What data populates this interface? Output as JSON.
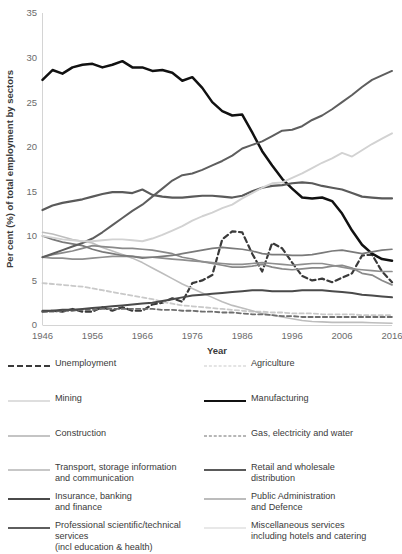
{
  "chart_data": {
    "type": "line",
    "title": "",
    "xlabel": "Year",
    "ylabel": "Per cent (%) of total employment by sectors",
    "xlim": [
      1946,
      2016
    ],
    "ylim": [
      0,
      35
    ],
    "ytick_labels": [
      "0",
      "5",
      "10",
      "15",
      "20",
      "25",
      "30",
      "35"
    ],
    "yticks": [
      0,
      5,
      10,
      15,
      20,
      25,
      30,
      35
    ],
    "xtick_labels": [
      "1946",
      "1956",
      "1966",
      "1976",
      "1986",
      "1996",
      "2006",
      "2016"
    ],
    "xticks": [
      1946,
      1956,
      1966,
      1976,
      1986,
      1996,
      2006,
      2016
    ],
    "grid": false,
    "legend_position": "below",
    "x": [
      1946,
      1948,
      1950,
      1952,
      1954,
      1956,
      1958,
      1960,
      1962,
      1964,
      1966,
      1968,
      1970,
      1972,
      1974,
      1976,
      1978,
      1980,
      1982,
      1984,
      1986,
      1988,
      1990,
      1992,
      1994,
      1996,
      1998,
      2000,
      2002,
      2004,
      2006,
      2008,
      2010,
      2012,
      2014,
      2016
    ],
    "series": [
      {
        "name": "Unemployment",
        "color": "#3a3a3a",
        "style": "dashed",
        "width": 2.2,
        "values": [
          1.5,
          1.6,
          1.5,
          1.8,
          1.5,
          1.5,
          2.0,
          1.6,
          2.0,
          1.6,
          1.6,
          2.3,
          2.5,
          3.0,
          2.6,
          4.7,
          5.0,
          5.6,
          9.6,
          10.5,
          10.4,
          8.0,
          6.0,
          9.2,
          8.6,
          7.0,
          5.5,
          5.0,
          5.2,
          4.8,
          5.3,
          5.8,
          7.8,
          7.9,
          6.0,
          4.8
        ]
      },
      {
        "name": "Agriculture",
        "color": "#c9c9c9",
        "style": "dashed",
        "width": 1.8,
        "values": [
          4.7,
          4.6,
          4.5,
          4.4,
          4.3,
          4.1,
          3.9,
          3.7,
          3.5,
          3.3,
          3.1,
          2.9,
          2.6,
          2.4,
          2.2,
          2.1,
          2.0,
          1.9,
          1.8,
          1.7,
          1.6,
          1.5,
          1.5,
          1.4,
          1.4,
          1.3,
          1.3,
          1.3,
          1.2,
          1.2,
          1.2,
          1.2,
          1.1,
          1.1,
          1.1,
          1.1
        ]
      },
      {
        "name": "Mining",
        "color": "#bdbdbd",
        "style": "solid",
        "width": 1.6,
        "values": [
          10.4,
          10.2,
          9.9,
          9.6,
          9.4,
          9.2,
          8.7,
          8.3,
          7.9,
          7.5,
          7.0,
          6.4,
          5.8,
          5.2,
          4.6,
          4.1,
          3.6,
          3.1,
          2.6,
          2.2,
          1.9,
          1.6,
          1.3,
          1.1,
          0.9,
          0.7,
          0.5,
          0.4,
          0.35,
          0.3,
          0.3,
          0.3,
          0.3,
          0.25,
          0.22,
          0.2
        ]
      },
      {
        "name": "Manufacturing",
        "color": "#111111",
        "style": "solid",
        "width": 2.5,
        "values": [
          27.5,
          28.6,
          28.2,
          28.9,
          29.2,
          29.3,
          28.9,
          29.2,
          29.6,
          28.9,
          28.9,
          28.5,
          28.6,
          28.3,
          27.4,
          27.8,
          26.6,
          25.0,
          24.0,
          23.5,
          23.6,
          21.6,
          19.5,
          17.9,
          16.4,
          15.3,
          14.3,
          14.2,
          14.3,
          13.9,
          12.5,
          10.6,
          9.0,
          8.0,
          7.4,
          7.2
        ]
      },
      {
        "name": "Construction",
        "color": "#8a8a8a",
        "style": "solid",
        "width": 1.7,
        "values": [
          7.6,
          7.9,
          8.1,
          8.3,
          8.6,
          8.9,
          8.8,
          8.7,
          8.6,
          8.6,
          8.5,
          8.4,
          8.2,
          8.0,
          7.6,
          7.4,
          7.1,
          6.9,
          6.7,
          6.5,
          6.5,
          6.6,
          6.8,
          6.5,
          6.3,
          6.2,
          6.3,
          6.4,
          6.4,
          6.6,
          6.7,
          6.4,
          5.8,
          5.6,
          5.0,
          4.5
        ]
      },
      {
        "name": "Gas, electricity and water",
        "color": "#6e6e6e",
        "style": "dashed",
        "width": 1.8,
        "values": [
          1.5,
          1.5,
          1.6,
          1.6,
          1.7,
          1.7,
          1.8,
          1.8,
          1.8,
          1.8,
          1.8,
          1.8,
          1.7,
          1.7,
          1.6,
          1.6,
          1.5,
          1.5,
          1.4,
          1.4,
          1.3,
          1.2,
          1.2,
          1.1,
          1.0,
          1.0,
          0.9,
          0.9,
          0.9,
          0.9,
          0.9,
          0.9,
          0.9,
          0.9,
          0.9,
          0.9
        ]
      },
      {
        "name": "Transport, storage information and communication",
        "color": "#8f8f8f",
        "style": "solid",
        "width": 1.7,
        "values": [
          7.6,
          7.5,
          7.5,
          7.4,
          7.4,
          7.5,
          7.6,
          7.7,
          7.7,
          7.7,
          7.6,
          7.6,
          7.5,
          7.4,
          7.3,
          7.2,
          7.1,
          7.0,
          6.9,
          6.8,
          6.8,
          6.9,
          7.0,
          6.9,
          6.8,
          6.7,
          6.8,
          6.9,
          6.9,
          6.7,
          6.5,
          6.3,
          6.2,
          6.1,
          6.0,
          6.0
        ]
      },
      {
        "name": "Retail and wholesale distribution",
        "color": "#5a5a5a",
        "style": "solid",
        "width": 2.2,
        "values": [
          12.9,
          13.4,
          13.7,
          13.9,
          14.1,
          14.4,
          14.7,
          14.9,
          14.9,
          14.8,
          15.2,
          14.6,
          14.4,
          14.3,
          14.3,
          14.4,
          14.5,
          14.5,
          14.4,
          14.3,
          14.5,
          15.0,
          15.4,
          15.6,
          15.7,
          15.9,
          16.0,
          15.9,
          15.6,
          15.4,
          15.2,
          14.8,
          14.4,
          14.3,
          14.2,
          14.2
        ]
      },
      {
        "name": "Insurance, banking and finance",
        "color": "#4a4a4a",
        "style": "solid",
        "width": 2.0,
        "values": [
          1.6,
          1.6,
          1.7,
          1.7,
          1.8,
          1.9,
          2.0,
          2.1,
          2.2,
          2.3,
          2.4,
          2.5,
          2.7,
          2.9,
          3.1,
          3.3,
          3.4,
          3.5,
          3.6,
          3.7,
          3.8,
          3.9,
          3.9,
          3.8,
          3.8,
          3.8,
          3.9,
          3.9,
          3.9,
          3.8,
          3.7,
          3.6,
          3.4,
          3.3,
          3.2,
          3.1
        ]
      },
      {
        "name": "Public Administration and Defence",
        "color": "#7a7a7a",
        "style": "solid",
        "width": 1.7,
        "values": [
          10.0,
          9.6,
          9.3,
          9.1,
          8.9,
          8.5,
          8.2,
          8.0,
          7.8,
          7.7,
          7.5,
          7.6,
          7.7,
          7.8,
          8.0,
          8.2,
          8.4,
          8.6,
          8.7,
          8.6,
          8.5,
          8.3,
          8.0,
          7.9,
          7.9,
          7.8,
          7.8,
          7.9,
          8.1,
          8.3,
          8.4,
          8.2,
          8.0,
          8.2,
          8.4,
          8.5
        ]
      },
      {
        "name": "Professional scientific/technical services (incl education & health)",
        "color": "#5e5e5e",
        "style": "solid",
        "width": 2.0,
        "values": [
          7.6,
          8.0,
          8.4,
          8.8,
          9.2,
          9.7,
          10.4,
          11.2,
          12.0,
          12.8,
          13.5,
          14.4,
          15.3,
          16.2,
          16.8,
          17.0,
          17.4,
          17.9,
          18.4,
          19.0,
          19.8,
          20.2,
          20.6,
          21.2,
          21.8,
          21.9,
          22.3,
          23.0,
          23.5,
          24.2,
          25.0,
          25.8,
          26.7,
          27.5,
          28.0,
          28.5
        ]
      },
      {
        "name": "Miscellaneous services including hotels and catering",
        "color": "#d2d2d2",
        "style": "solid",
        "width": 1.9,
        "values": [
          10.0,
          9.8,
          9.6,
          9.5,
          9.4,
          9.4,
          9.5,
          9.6,
          9.6,
          9.5,
          9.4,
          9.7,
          10.1,
          10.6,
          11.1,
          11.7,
          12.2,
          12.6,
          13.1,
          13.5,
          14.2,
          14.8,
          15.4,
          15.9,
          16.0,
          16.5,
          17.0,
          17.6,
          18.2,
          18.7,
          19.3,
          18.9,
          19.6,
          20.3,
          20.9,
          21.5
        ]
      }
    ]
  },
  "axis": {
    "ylabel": "Per cent (%) of total employment by sectors",
    "xlabel": "Year"
  },
  "legend": {
    "left": [
      {
        "label": "Unemployment",
        "color": "#3a3a3a",
        "style": "dashed",
        "width": 2.4
      },
      {
        "label": "Mining",
        "color": "#bdbdbd",
        "style": "solid",
        "width": 1.6
      },
      {
        "label": "Construction",
        "color": "#8a8a8a",
        "style": "solid",
        "width": 1.7
      },
      {
        "label": "Transport, storage information\n and communication",
        "color": "#8f8f8f",
        "style": "solid",
        "width": 1.7
      },
      {
        "label": "Insurance, banking\nand finance",
        "color": "#4a4a4a",
        "style": "solid",
        "width": 2.0
      },
      {
        "label": "Professional scientific/technical services\n(incl education & health)",
        "color": "#5e5e5e",
        "style": "solid",
        "width": 2.0
      }
    ],
    "right": [
      {
        "label": "Agriculture",
        "color": "#c9c9c9",
        "style": "dashed",
        "width": 1.8
      },
      {
        "label": "Manufacturing",
        "color": "#111111",
        "style": "solid",
        "width": 2.6
      },
      {
        "label": "Gas, electricity and water",
        "color": "#6e6e6e",
        "style": "dashed",
        "width": 1.9
      },
      {
        "label": "Retail and wholesale\ndistribution",
        "color": "#5a5a5a",
        "style": "solid",
        "width": 2.2
      },
      {
        "label": "Public Administration\n and Defence",
        "color": "#7a7a7a",
        "style": "solid",
        "width": 1.7
      },
      {
        "label": "Miscellaneous services\nincluding hotels and catering",
        "color": "#d2d2d2",
        "style": "solid",
        "width": 1.9
      }
    ]
  }
}
